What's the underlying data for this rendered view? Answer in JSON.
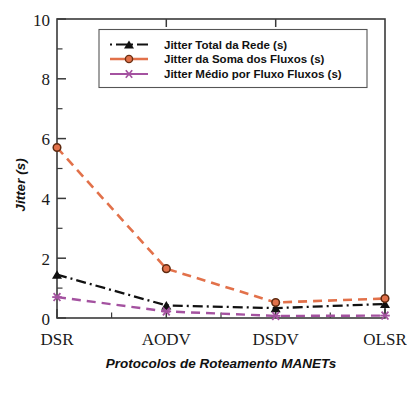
{
  "chart_data": {
    "type": "line",
    "title": "",
    "subtitle": "",
    "xlabel": "Protocolos de Roteamento MANETs",
    "ylabel": "Jitter (s)",
    "categories": [
      "DSR",
      "AODV",
      "DSDV",
      "OLSR"
    ],
    "ylim": [
      0,
      10
    ],
    "yticks": [
      0,
      2,
      4,
      6,
      8,
      10
    ],
    "ytick_labels": [
      "0",
      "2",
      "4",
      "6",
      "8",
      "10"
    ],
    "yminor_ticks": [
      1,
      3,
      5,
      7,
      9
    ],
    "xtick_labels": [
      "DSR",
      "AODV",
      "DSDV",
      "OLSR"
    ],
    "grid": false,
    "legend_position": "top-center",
    "series": [
      {
        "name": "Jitter Total da Rede (s)",
        "values": [
          1.45,
          0.42,
          0.33,
          0.47
        ],
        "color": "#111111",
        "marker": "triangle",
        "linestyle": "dashdot"
      },
      {
        "name": "Jitter da Soma dos Fluxos  (s)",
        "values": [
          5.7,
          1.65,
          0.52,
          0.65
        ],
        "color": "#E2714A",
        "marker": "circle",
        "linestyle": "dashed"
      },
      {
        "name": "Jitter Médio por Fluxo Fluxos  (s)",
        "values": [
          0.7,
          0.22,
          0.07,
          0.08
        ],
        "color": "#A452A0",
        "marker": "star",
        "linestyle": "dashed"
      }
    ]
  },
  "axes": {
    "y_axis_label": "Jitter (s)",
    "x_axis_label": "Protocolos de Roteamento MANETs",
    "y_tick_0": "0",
    "y_tick_1": "2",
    "y_tick_2": "4",
    "y_tick_3": "6",
    "y_tick_4": "8",
    "y_tick_5": "10",
    "x_tick_0": "DSR",
    "x_tick_1": "AODV",
    "x_tick_2": "DSDV",
    "x_tick_3": "OLSR"
  },
  "legend": {
    "entries": [
      {
        "label": "Jitter Total da Rede (s)"
      },
      {
        "label": "Jitter da Soma dos Fluxos  (s)"
      },
      {
        "label": "Jitter Médio por Fluxo Fluxos  (s)"
      }
    ]
  },
  "colors": {
    "series_black": "#111111",
    "series_orange": "#E2714A",
    "series_purple": "#A452A0",
    "frame": "#3a3a3a",
    "background": "#ffffff"
  }
}
